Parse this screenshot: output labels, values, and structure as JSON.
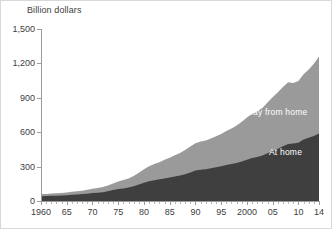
{
  "chart_data": {
    "type": "area",
    "stacked": true,
    "title": "",
    "subtitle": "",
    "xlabel": "",
    "ylabel": "Billion dollars",
    "ylim": [
      0,
      1500
    ],
    "xlim": [
      1960,
      2014
    ],
    "grid": false,
    "legend_position": "inline",
    "ytick_labels": [
      "0",
      "300",
      "600",
      "900",
      "1,200",
      "1,500"
    ],
    "ytick_values": [
      0,
      300,
      600,
      900,
      1200,
      1500
    ],
    "xtick_labels": [
      "1960",
      "65",
      "70",
      "75",
      "80",
      "85",
      "90",
      "95",
      "2000",
      "05",
      "10",
      "14"
    ],
    "xtick_values": [
      1960,
      1965,
      1970,
      1975,
      1980,
      1985,
      1990,
      1995,
      2000,
      2005,
      2010,
      2014
    ],
    "x": [
      1960,
      1961,
      1962,
      1963,
      1964,
      1965,
      1966,
      1967,
      1968,
      1969,
      1970,
      1971,
      1972,
      1973,
      1974,
      1975,
      1976,
      1977,
      1978,
      1979,
      1980,
      1981,
      1982,
      1983,
      1984,
      1985,
      1986,
      1987,
      1988,
      1989,
      1990,
      1991,
      1992,
      1993,
      1994,
      1995,
      1996,
      1997,
      1998,
      1999,
      2000,
      2001,
      2002,
      2003,
      2004,
      2005,
      2006,
      2007,
      2008,
      2009,
      2010,
      2011,
      2012,
      2013,
      2014
    ],
    "series": [
      {
        "name": "At home",
        "color": "#3f3f3f",
        "values": [
          42,
          43,
          45,
          46,
          48,
          51,
          54,
          56,
          60,
          64,
          69,
          72,
          77,
          85,
          95,
          104,
          110,
          117,
          128,
          143,
          160,
          173,
          182,
          189,
          197,
          204,
          214,
          222,
          233,
          249,
          265,
          273,
          277,
          285,
          294,
          302,
          314,
          323,
          332,
          345,
          359,
          374,
          383,
          396,
          417,
          436,
          455,
          477,
          498,
          501,
          507,
          536,
          551,
          567,
          588
        ]
      },
      {
        "name": "Away from home",
        "color": "#9a9a9a",
        "values": [
          18,
          19,
          20,
          21,
          22,
          24,
          26,
          28,
          30,
          34,
          38,
          41,
          45,
          51,
          57,
          65,
          73,
          80,
          91,
          103,
          117,
          130,
          140,
          150,
          163,
          173,
          185,
          197,
          212,
          226,
          238,
          245,
          250,
          260,
          271,
          283,
          296,
          310,
          326,
          347,
          370,
          387,
          400,
          415,
          442,
          468,
          494,
          518,
          538,
          527,
          539,
          570,
          596,
          629,
          673
        ]
      }
    ],
    "totals": [
      60,
      62,
      65,
      67,
      70,
      75,
      80,
      84,
      90,
      98,
      107,
      113,
      122,
      136,
      152,
      169,
      183,
      197,
      219,
      246,
      277,
      303,
      322,
      339,
      360,
      377,
      399,
      419,
      445,
      475,
      503,
      518,
      527,
      545,
      565,
      585,
      610,
      633,
      658,
      692,
      729,
      761,
      783,
      811,
      859,
      904,
      949,
      995,
      1036,
      1028,
      1046,
      1106,
      1147,
      1196,
      1261
    ],
    "series_labels": [
      {
        "name": "away-from-home-label",
        "text": "Away from home"
      },
      {
        "name": "at-home-label",
        "text": "At home"
      }
    ]
  }
}
